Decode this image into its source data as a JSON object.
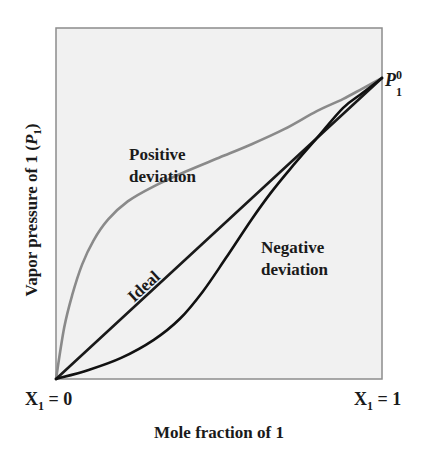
{
  "chart_data": {
    "type": "line",
    "title": "",
    "xlabel": "Mole fraction of 1",
    "ylabel": "Vapor pressure of 1 (P1)",
    "ylabel_parts": {
      "text": "Vapor pressure of 1 (",
      "var": "P",
      "sub": "1",
      "close": ")"
    },
    "x_tick_labels": [
      {
        "x": 0,
        "base": "X",
        "sub": "1",
        "rest": " = 0"
      },
      {
        "x": 1,
        "base": "X",
        "sub": "1",
        "rest": " = 1"
      }
    ],
    "endpoint_label": {
      "base": "P",
      "sup": "0",
      "sub": "1"
    },
    "xlim": [
      0,
      1
    ],
    "ylim": [
      0,
      1.16
    ],
    "grid": false,
    "legend": "none (inline annotations)",
    "series": [
      {
        "name": "Positive deviation",
        "label_lines": [
          "Positive",
          "deviation"
        ],
        "color": "#8a8a8a",
        "x": [
          0,
          0.025,
          0.05,
          0.08,
          0.115,
          0.16,
          0.22,
          0.3,
          0.4,
          0.5,
          0.6,
          0.7,
          0.8,
          0.88,
          0.94,
          1.0
        ],
        "y": [
          0,
          0.17,
          0.28,
          0.38,
          0.46,
          0.53,
          0.59,
          0.64,
          0.69,
          0.735,
          0.78,
          0.83,
          0.89,
          0.93,
          0.965,
          1.0
        ]
      },
      {
        "name": "Ideal",
        "label_lines": [
          "Ideal"
        ],
        "color": "#1a1a1a",
        "x": [
          0,
          1
        ],
        "y": [
          0,
          1
        ]
      },
      {
        "name": "Negative deviation",
        "label_lines": [
          "Negative",
          "deviation"
        ],
        "color": "#111111",
        "x": [
          0,
          0.1,
          0.2,
          0.3,
          0.38,
          0.45,
          0.52,
          0.6,
          0.66,
          0.72,
          0.8,
          0.88,
          0.94,
          1.0
        ],
        "y": [
          0,
          0.03,
          0.07,
          0.13,
          0.2,
          0.29,
          0.4,
          0.53,
          0.62,
          0.7,
          0.8,
          0.9,
          0.95,
          1.0
        ]
      }
    ]
  },
  "style": {
    "plot_bg": "#f1f1f1",
    "frame_color": "#8c8c8c"
  }
}
